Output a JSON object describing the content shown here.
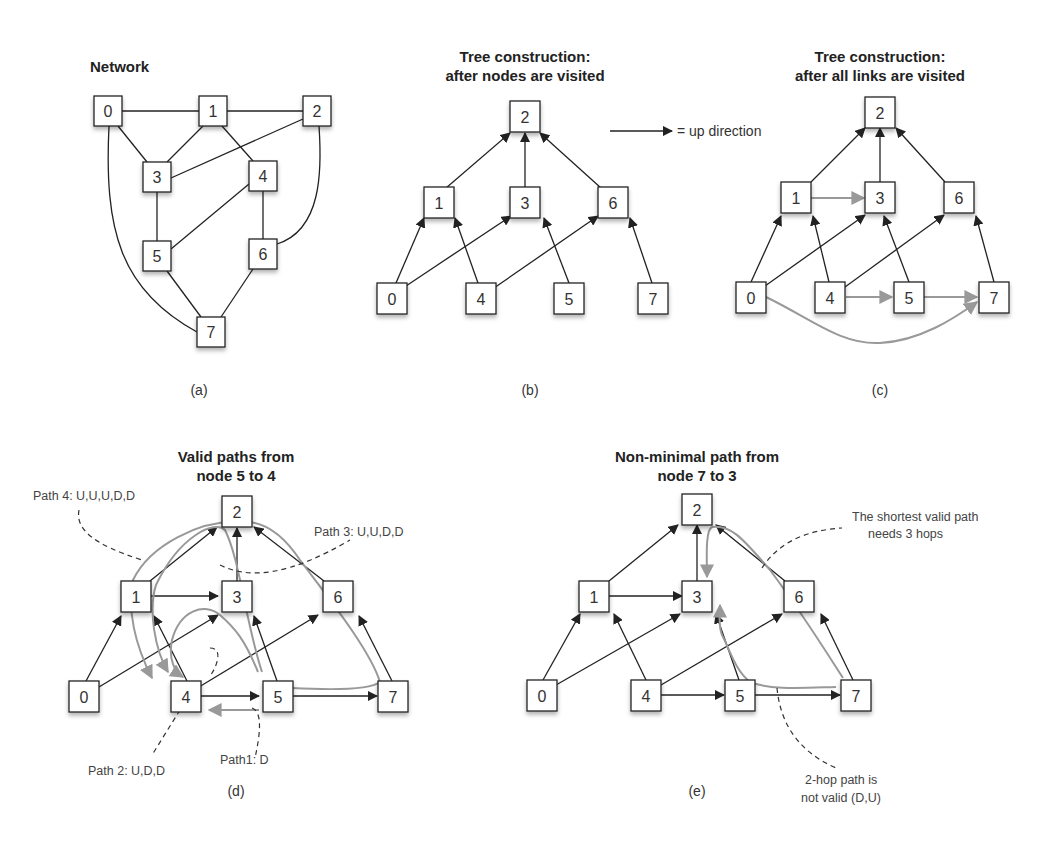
{
  "panels": {
    "a": {
      "title": "Network",
      "caption": "(a)",
      "nodes": [
        {
          "id": "0",
          "x": 108,
          "y": 111
        },
        {
          "id": "1",
          "x": 213,
          "y": 111
        },
        {
          "id": "2",
          "x": 317,
          "y": 111
        },
        {
          "id": "3",
          "x": 157,
          "y": 177
        },
        {
          "id": "4",
          "x": 263,
          "y": 176
        },
        {
          "id": "5",
          "x": 157,
          "y": 256
        },
        {
          "id": "6",
          "x": 263,
          "y": 254
        },
        {
          "id": "7",
          "x": 211,
          "y": 332
        }
      ],
      "links": [
        [
          "0",
          "1"
        ],
        [
          "1",
          "2"
        ],
        [
          "0",
          "3"
        ],
        [
          "1",
          "3"
        ],
        [
          "2",
          "3"
        ],
        [
          "1",
          "4"
        ],
        [
          "3",
          "5"
        ],
        [
          "4",
          "5"
        ],
        [
          "4",
          "6"
        ],
        [
          "2",
          "6"
        ],
        [
          "5",
          "7"
        ],
        [
          "6",
          "7"
        ],
        [
          "0",
          "7"
        ]
      ]
    },
    "b": {
      "title_line1": "Tree construction:",
      "title_line2": "after nodes are visited",
      "caption": "(b)",
      "legend": "= up direction"
    },
    "c": {
      "title_line1": "Tree construction:",
      "title_line2": "after all links are visited",
      "caption": "(c)"
    },
    "d": {
      "title_line1": "Valid paths from",
      "title_line2": "node 5 to 4",
      "caption": "(d)",
      "annotations": {
        "path1": "Path1: D",
        "path2": "Path 2: U,D,D",
        "path3": "Path 3: U,U,D,D",
        "path4": "Path 4: U,U,U,D,D"
      }
    },
    "e": {
      "title_line1": "Non-minimal path from",
      "title_line2": "node 7 to 3",
      "caption": "(e)",
      "annotations": {
        "shortest_line1": "The shortest valid path",
        "shortest_line2": "needs 3 hops",
        "invalid_line1": "2-hop path is",
        "invalid_line2": "not valid (D,U)"
      }
    }
  },
  "tree_up_links": [
    [
      "1",
      "2"
    ],
    [
      "3",
      "2"
    ],
    [
      "6",
      "2"
    ],
    [
      "0",
      "1"
    ],
    [
      "4",
      "1"
    ],
    [
      "0",
      "3"
    ],
    [
      "5",
      "3"
    ],
    [
      "4",
      "6"
    ],
    [
      "7",
      "6"
    ]
  ],
  "tree_extra_links": [
    [
      "1",
      "3"
    ],
    [
      "4",
      "5"
    ],
    [
      "5",
      "7"
    ],
    [
      "0",
      "7"
    ]
  ],
  "node_labels": [
    "0",
    "1",
    "2",
    "3",
    "4",
    "5",
    "6",
    "7"
  ],
  "colors": {
    "edge": "#222222",
    "highlight": "#999999",
    "dashed": "#333333"
  }
}
